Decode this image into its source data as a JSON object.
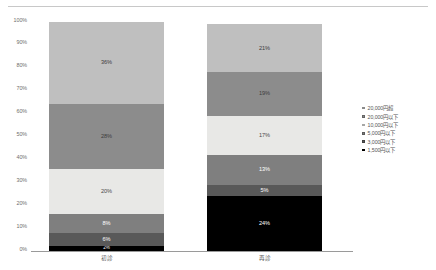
{
  "chart_data": {
    "type": "bar",
    "stacked": true,
    "stack_mode": "percent",
    "title": "",
    "xlabel": "",
    "ylabel": "",
    "ylim": [
      0,
      100
    ],
    "ytick_labels": [
      "100%",
      "90%",
      "80%",
      "70%",
      "60%",
      "50%",
      "40%",
      "30%",
      "20%",
      "10%",
      "0%"
    ],
    "ytick_values": [
      100,
      90,
      80,
      70,
      60,
      50,
      40,
      30,
      20,
      10,
      0
    ],
    "grid": false,
    "legend_position": "right",
    "categories": [
      "初診",
      "再診"
    ],
    "series": [
      {
        "name": "1,500円以下",
        "color": "#000000",
        "values": [
          2,
          24
        ],
        "labels": [
          "2%",
          "24%"
        ],
        "label_colors": [
          "#ffffff",
          "#ffffff"
        ]
      },
      {
        "name": "3,000円以下",
        "color": "#595959",
        "values": [
          6,
          5
        ],
        "labels": [
          "6%",
          "5%"
        ],
        "label_colors": [
          "#ffffff",
          "#ffffff"
        ]
      },
      {
        "name": "5,000円以下",
        "color": "#7f7f7f",
        "values": [
          8,
          13
        ],
        "labels": [
          "8%",
          "13%"
        ],
        "label_colors": [
          "#ffffff",
          "#ffffff"
        ]
      },
      {
        "name": "10,000円以下",
        "color": "#e8e8e6",
        "values": [
          20,
          17
        ],
        "labels": [
          "20%",
          "17%"
        ],
        "label_colors": [
          "#4a4a4a",
          "#4a4a4a"
        ]
      },
      {
        "name": "20,000円以下",
        "color": "#8c8c8c",
        "values": [
          28,
          19
        ],
        "labels": [
          "28%",
          "19%"
        ],
        "label_colors": [
          "#3c3c3c",
          "#3c3c3c"
        ]
      },
      {
        "name": "20,000円超",
        "color": "#bfbfbf",
        "values": [
          36,
          21
        ],
        "labels": [
          "36%",
          "21%"
        ],
        "label_colors": [
          "#3c3c3c",
          "#3c3c3c"
        ]
      }
    ],
    "legend_entries": [
      {
        "label": "20,000円超",
        "color": "#bfbfbf"
      },
      {
        "label": "20,000円以下",
        "color": "#8c8c8c"
      },
      {
        "label": "10,000円以下",
        "color": "#e8e8e6"
      },
      {
        "label": "5,000円以下",
        "color": "#7f7f7f"
      },
      {
        "label": "3,000円以下",
        "color": "#595959"
      },
      {
        "label": "1,500円以下",
        "color": "#000000"
      }
    ]
  }
}
